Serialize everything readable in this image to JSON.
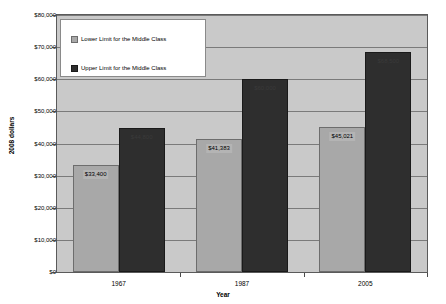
{
  "chart_data": {
    "type": "bar",
    "title": "",
    "xlabel": "Year",
    "ylabel": "2008 dollars",
    "categories": [
      "1967",
      "1987",
      "2005"
    ],
    "series": [
      {
        "name": "Lower Limit for the Middle Class",
        "color": "#a8a8a8",
        "values": [
          33400,
          41383,
          45021
        ],
        "labels": [
          "$33,400",
          "$41,383",
          "$45,021"
        ]
      },
      {
        "name": "Upper Limit for the Middle Class",
        "color": "#2e2e2e",
        "values": [
          44800,
          60000,
          68500
        ],
        "labels": [
          "$44,800",
          "$60,000",
          "$68,500"
        ]
      }
    ],
    "ylim": [
      0,
      80000
    ],
    "ytick_values": [
      0,
      10000,
      20000,
      30000,
      40000,
      50000,
      60000,
      70000,
      80000
    ],
    "ytick_labels": [
      "$0",
      "$10,000",
      "$20,000",
      "$30,000",
      "$40,000",
      "$50,000",
      "$60,000",
      "$70,000",
      "$80,000"
    ],
    "grid": true,
    "legend_position": "top-left-inside",
    "plot_background": "#c9c9c9"
  },
  "legend": {
    "items": [
      {
        "label": "Lower Limit for the Middle Class"
      },
      {
        "label": "Upper Limit for the Middle Class"
      }
    ]
  },
  "axes": {
    "x_title": "Year",
    "y_title": "2008 dollars"
  }
}
